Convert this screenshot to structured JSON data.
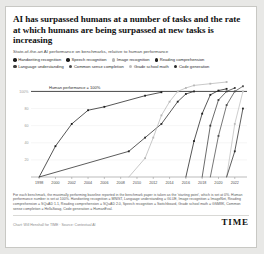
{
  "title": "AI has surpassed humans at a number of tasks and the rate at which humans are being surpassed at new tasks is increasing",
  "subtitle": "State-of-the-art AI performance on benchmarks, relative to human performance",
  "annotation": "Human performance = 100%",
  "footnote": "For each benchmark, the maximally performing baseline reported in the benchmark paper is taken as the 'starting point', which is set at 0%. Human performance number is set at 100%. Handwriting recognition = MNIST, Language understanding = GLUE, Image recognition = ImageNet, Reading comprehension = SQuAD 1.1, Reading comprehension = SQuAD 2.0, Speech recognition = Switchboard, Grade school math = GSM8K, Common sense completion = HellaSwag, Code generation = HumanEval.",
  "credit": "Chart: Will Henshall for TIME · Source: Contextual AI",
  "brand": "TIME",
  "colors": {
    "series_dark": "#1d1d1d",
    "series_mid": "#555555",
    "series_light": "#a9a9a9",
    "series_pale": "#c9c9c9",
    "human_line": "#4a4a4a",
    "grid": "#ededed",
    "axis": "#8d8d8d"
  },
  "legend_rows": [
    [
      {
        "label": "Handwriting recognition",
        "color": "#1d1d1d"
      },
      {
        "label": "Speech recognition",
        "color": "#1d1d1d"
      },
      {
        "label": "Image recognition",
        "color": "#b6b6b6"
      },
      {
        "label": "Reading comprehension",
        "color": "#1d1d1d"
      }
    ],
    [
      {
        "label": "Language understanding",
        "color": "#3a3a3a"
      },
      {
        "label": "Common sense completion",
        "color": "#4a4a4a"
      },
      {
        "label": "Grade school math",
        "color": "#bdbdbd"
      },
      {
        "label": "Code generation",
        "color": "#2a2a2a"
      }
    ]
  ],
  "chart_data": {
    "type": "line",
    "title": "AI has surpassed humans at a number of tasks and the rate at which humans are being surpassed at new tasks is increasing",
    "subtitle": "State-of-the-art AI performance on benchmarks, relative to human performance",
    "xlabel": "",
    "ylabel": "",
    "xlim": [
      1997,
      2023.5
    ],
    "ylim": [
      0,
      118
    ],
    "grid": true,
    "legend_position": "top",
    "xticks": [
      1998,
      2000,
      2002,
      2004,
      2006,
      2008,
      2010,
      2012,
      2014,
      2016,
      2018,
      2020,
      2022
    ],
    "yticks": [
      20,
      40,
      60,
      80,
      100
    ],
    "ytick_labels": [
      "20",
      "40",
      "60",
      "80",
      "100%"
    ],
    "reference_line": {
      "value": 100,
      "label": "Human performance = 100%"
    },
    "series": [
      {
        "name": "Handwriting recognition",
        "color": "#1d1d1d",
        "x": [
          1998,
          2000,
          2002,
          2004,
          2006,
          2011,
          2013
        ],
        "y": [
          0,
          36,
          62,
          78,
          82,
          95,
          99
        ]
      },
      {
        "name": "Speech recognition",
        "color": "#262626",
        "x": [
          1998,
          2009,
          2011,
          2013,
          2015,
          2016,
          2017
        ],
        "y": [
          0,
          30,
          46,
          62,
          88,
          97,
          100
        ]
      },
      {
        "name": "Image recognition",
        "color": "#b6b6b6",
        "x": [
          2009,
          2011,
          2012,
          2013,
          2014,
          2015,
          2016,
          2017,
          2019,
          2021
        ],
        "y": [
          0,
          22,
          46,
          72,
          88,
          100,
          104,
          107,
          109,
          111
        ]
      },
      {
        "name": "Reading comprehension",
        "color": "#1d1d1d",
        "x": [
          2016,
          2017,
          2018,
          2019,
          2020,
          2021
        ],
        "y": [
          0,
          42,
          74,
          96,
          101,
          103
        ]
      },
      {
        "name": "Language understanding",
        "color": "#3a3a3a",
        "x": [
          2018,
          2019,
          2020,
          2021,
          2022
        ],
        "y": [
          0,
          60,
          90,
          100,
          104
        ]
      },
      {
        "name": "Common sense completion",
        "color": "#4a4a4a",
        "x": [
          2019,
          2020,
          2021,
          2022,
          2023
        ],
        "y": [
          0,
          48,
          84,
          100,
          106
        ]
      },
      {
        "name": "Grade school math",
        "color": "#bdbdbd",
        "x": [
          2021,
          2022,
          2023
        ],
        "y": [
          0,
          62,
          100
        ]
      },
      {
        "name": "Code generation",
        "color": "#2a2a2a",
        "x": [
          2021,
          2022,
          2023
        ],
        "y": [
          0,
          30,
          80
        ]
      }
    ]
  }
}
